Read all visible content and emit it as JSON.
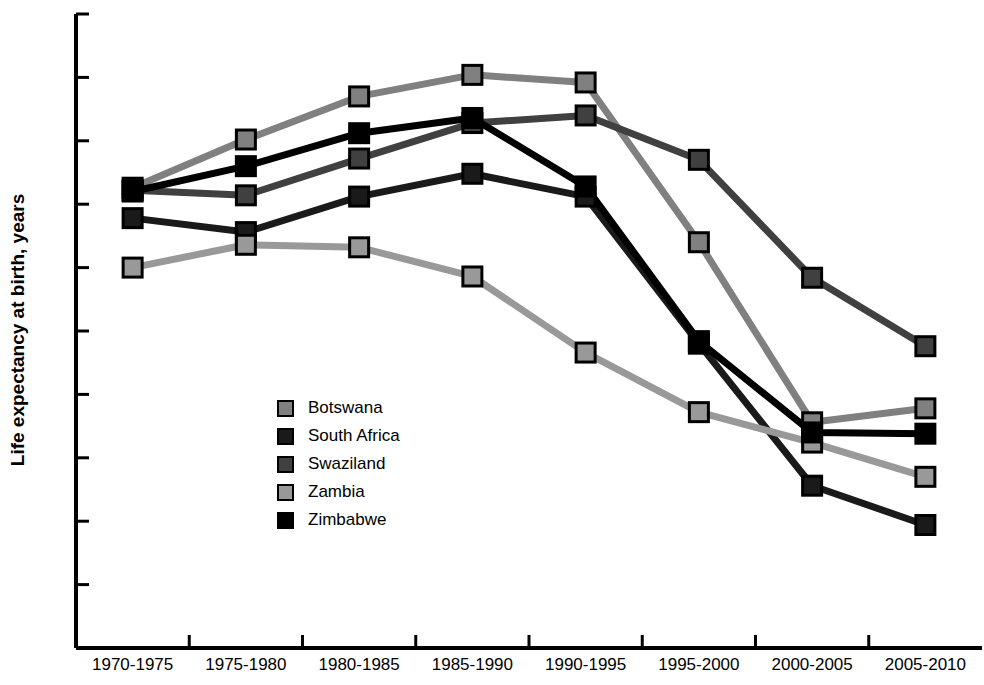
{
  "chart_data": {
    "type": "line",
    "title": "",
    "xlabel": "",
    "ylabel": "Life expectancy at birth, years",
    "ylim": [
      20,
      70
    ],
    "ytick_step": 5,
    "yticks": [
      20,
      25,
      30,
      35,
      40,
      45,
      50,
      55,
      60,
      65,
      70
    ],
    "grid": false,
    "legend_position": "center-left-inside",
    "marker": "square",
    "categories": [
      "1970-1975",
      "1975-1980",
      "1980-1985",
      "1985-1990",
      "1990-1995",
      "1995-2000",
      "2000-2005",
      "2005-2010"
    ],
    "series": [
      {
        "name": "Botswana",
        "color": "#808080",
        "values": [
          56.3,
          60.1,
          63.5,
          65.2,
          64.6,
          52.0,
          37.8,
          38.9
        ]
      },
      {
        "name": "South Africa",
        "color": "#1a1a1a",
        "values": [
          53.9,
          52.8,
          55.6,
          57.4,
          55.6,
          44.0,
          32.8,
          29.7
        ]
      },
      {
        "name": "Swaziland",
        "color": "#404040",
        "values": [
          56.1,
          55.7,
          58.6,
          61.4,
          62.0,
          58.5,
          49.2,
          43.8
        ]
      },
      {
        "name": "Zambia",
        "color": "#999999",
        "values": [
          50.0,
          51.8,
          51.6,
          49.3,
          43.3,
          38.6,
          36.2,
          33.5
        ]
      },
      {
        "name": "Zimbabwe",
        "color": "#000000",
        "values": [
          56.0,
          58.0,
          60.6,
          61.8,
          56.4,
          44.2,
          37.0,
          36.9
        ]
      }
    ]
  },
  "axis": {
    "y_title": "Life expectancy at birth, years"
  }
}
